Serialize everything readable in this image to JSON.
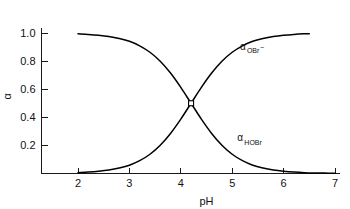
{
  "chart_data": {
    "type": "line",
    "title": "",
    "subtitle": "",
    "xlabel": "pH",
    "ylabel": "α",
    "xlim": [
      1.6,
      7.0
    ],
    "ylim": [
      0.0,
      1.08
    ],
    "grid": false,
    "legend_position": "inline-annotations",
    "xticks": [
      2,
      3,
      4,
      5,
      6,
      7
    ],
    "xtick_labels": [
      "2",
      "3",
      "4",
      "5",
      "6",
      "7"
    ],
    "yticks": [
      0.2,
      0.4,
      0.6,
      0.8,
      1.0
    ],
    "ytick_labels": [
      "0.2",
      "0.4",
      "0.6",
      "0.8",
      "1.0"
    ],
    "crossing_point": {
      "x": 4.2,
      "y": 0.5,
      "marker": "open-square"
    },
    "pka": 4.2,
    "series": [
      {
        "name": "alpha_HOBr",
        "label_main": "α",
        "label_sub": "HOBr",
        "label_sup": "",
        "label_x": 5.1,
        "label_y": 0.23,
        "x_start": 2.0,
        "x_end": 7.0,
        "x": [
          2.0,
          2.2,
          2.4,
          2.6,
          2.8,
          3.0,
          3.2,
          3.4,
          3.6,
          3.8,
          4.0,
          4.2,
          4.4,
          4.6,
          4.8,
          5.0,
          5.2,
          5.4,
          5.6,
          5.8,
          6.0,
          6.2,
          6.4,
          6.6,
          6.8,
          7.0
        ],
        "values": [
          0.994,
          0.99,
          0.984,
          0.975,
          0.961,
          0.941,
          0.909,
          0.863,
          0.799,
          0.715,
          0.613,
          0.5,
          0.387,
          0.285,
          0.201,
          0.137,
          0.091,
          0.059,
          0.039,
          0.025,
          0.016,
          0.01,
          0.006,
          0.004,
          0.003,
          0.002
        ]
      },
      {
        "name": "alpha_OBr_minus",
        "label_main": "α",
        "label_sub": "OBr",
        "label_sup": "−",
        "label_x": 5.15,
        "label_y": 0.88,
        "x_start": 2.0,
        "x_end": 6.5,
        "x": [
          2.0,
          2.2,
          2.4,
          2.6,
          2.8,
          3.0,
          3.2,
          3.4,
          3.6,
          3.8,
          4.0,
          4.2,
          4.4,
          4.6,
          4.8,
          5.0,
          5.2,
          5.4,
          5.6,
          5.8,
          6.0,
          6.2,
          6.4,
          6.5
        ],
        "values": [
          0.006,
          0.01,
          0.016,
          0.025,
          0.039,
          0.059,
          0.091,
          0.137,
          0.201,
          0.285,
          0.387,
          0.5,
          0.613,
          0.715,
          0.799,
          0.863,
          0.909,
          0.941,
          0.961,
          0.975,
          0.984,
          0.99,
          0.994,
          0.995
        ]
      }
    ],
    "colors": {
      "curve": "#000000",
      "axis": "#1a1a1a",
      "text": "#111111",
      "background": "#ffffff"
    }
  }
}
